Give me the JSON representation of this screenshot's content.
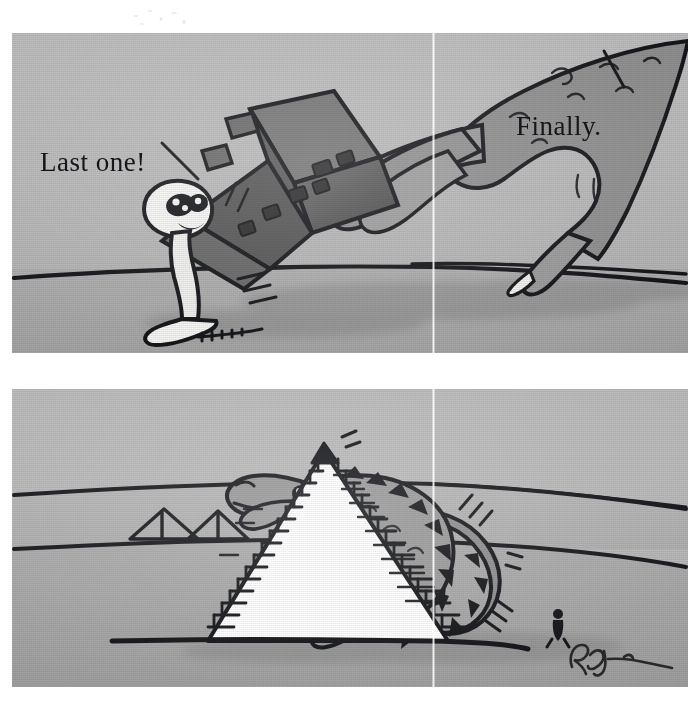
{
  "artwork": {
    "title": "Two-panel cartoon: dinosaur builds a pyramid",
    "signature": "Rogan",
    "colors": {
      "paper": "#ffffff",
      "panel_sky": "#b3b3b3",
      "panel_ground": "#a8a8a8",
      "ink": "#15161a",
      "creature_fill": "#8e8e8e",
      "creature_shade": "#6f6f6f",
      "block_dark": "#4a4a4a",
      "block_mid": "#6b6b6b",
      "figure_white": "#f4f4f2",
      "pyramid_white": "#ffffff",
      "shadow": "#8f8f8f"
    }
  },
  "panels": [
    {
      "id": "panel-top",
      "name": "top-panel",
      "captions": [
        {
          "id": "cap-last",
          "text": "Last one!",
          "leader": "points down-right to the straining white figure"
        },
        {
          "id": "cap-finally",
          "text": "Finally.",
          "leader": "points up-right to the giant reptilian claw"
        }
      ],
      "scene": "A giant scaly claw lowers the final dark capstone block onto a tiny straining white figure standing on the desert ground; long cast shadows stretch to the right."
    },
    {
      "id": "panel-bottom",
      "name": "bottom-panel",
      "captions": [
        {
          "id": "cap-click",
          "text": "CLICK",
          "leader": "sound effect at the pyramid apex"
        }
      ],
      "scene": "A large spiky-backed dinosaur leans over a finished white stepped pyramid and presses the capstone into place. Two small pyramids sit on the distant horizon at left and a tiny human silhouette stands at lower right for scale.",
      "signature": "Rogan"
    }
  ]
}
